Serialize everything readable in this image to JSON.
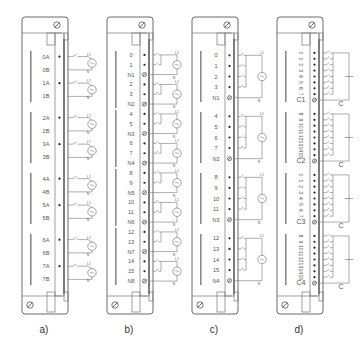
{
  "figure": {
    "panels": [
      {
        "id": "a",
        "caption": "a)",
        "kind": "isolated-ac-input",
        "groups": [
          {
            "terminals": [
              "0A",
              "0B",
              "1A",
              "1B"
            ]
          },
          {
            "terminals": [
              "2A",
              "2B",
              "3A",
              "3B"
            ]
          },
          {
            "terminals": [
              "4A",
              "4B",
              "5A",
              "5B"
            ]
          },
          {
            "terminals": [
              "6A",
              "6B",
              "7A",
              "7B"
            ]
          }
        ],
        "source_labels": {
          "line": "L1",
          "neutral": "N"
        }
      },
      {
        "id": "b",
        "caption": "b)",
        "kind": "ac-input-2-points-per-common",
        "groups": [
          {
            "terminals": [
              "0",
              "1",
              "N1"
            ]
          },
          {
            "terminals": [
              "2",
              "3",
              "N2"
            ]
          },
          {
            "terminals": [
              "4",
              "5",
              "N3"
            ]
          },
          {
            "terminals": [
              "6",
              "7",
              "N4"
            ]
          },
          {
            "terminals": [
              "8",
              "9",
              "N5"
            ]
          },
          {
            "terminals": [
              "10",
              "11",
              "N6"
            ]
          },
          {
            "terminals": [
              "12",
              "13",
              "N7"
            ]
          },
          {
            "terminals": [
              "14",
              "15",
              "N8"
            ]
          }
        ],
        "source_labels": {
          "line": "L1",
          "neutral": "N"
        }
      },
      {
        "id": "c",
        "caption": "c)",
        "kind": "ac-input-4-points-per-common",
        "groups": [
          {
            "terminals": [
              "0",
              "1",
              "2",
              "3",
              "N1"
            ]
          },
          {
            "terminals": [
              "4",
              "5",
              "6",
              "7",
              "N2"
            ]
          },
          {
            "terminals": [
              "8",
              "9",
              "10",
              "11",
              "N3"
            ]
          },
          {
            "terminals": [
              "12",
              "13",
              "14",
              "15",
              "N4"
            ]
          }
        ],
        "source_labels": {
          "line": "L1",
          "neutral": "N"
        }
      },
      {
        "id": "d",
        "caption": "d)",
        "kind": "dc-input-8-points-per-common",
        "groups": [
          {
            "terminals": [
              "0",
              "1",
              "2",
              "3",
              "4",
              "5",
              "6",
              "7",
              "C1"
            ]
          },
          {
            "terminals": [
              "8",
              "9",
              "10",
              "11",
              "12",
              "13",
              "14",
              "15",
              "C2"
            ]
          },
          {
            "terminals": [
              "0",
              "1",
              "2",
              "3",
              "4",
              "5",
              "6",
              "7",
              "C3"
            ]
          },
          {
            "terminals": [
              "8",
              "9",
              "10",
              "11",
              "12",
              "13",
              "14",
              "15",
              "C4"
            ]
          }
        ],
        "source_labels": {
          "common": "C"
        }
      }
    ]
  }
}
